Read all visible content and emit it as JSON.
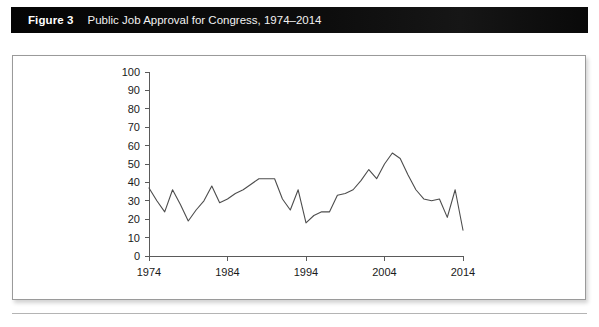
{
  "figure": {
    "label": "Figure 3",
    "title": "Public Job Approval for Congress, 1974–2014"
  },
  "colors": {
    "titlebar_background": "#0b0b0b",
    "titlebar_text": "#ffffff",
    "frame_border": "#9a9a9a",
    "axis": "#5a5a5a",
    "series_line": "#4d4d4d",
    "page_background": "#ffffff"
  },
  "chart_data": {
    "type": "line",
    "title": "Public Job Approval for Congress, 1974–2014",
    "xlabel": "",
    "ylabel": "",
    "xlim": [
      1974,
      2014
    ],
    "ylim": [
      0,
      100
    ],
    "grid": false,
    "legend": false,
    "legend_position": "none",
    "x_tick_labels": [
      "1974",
      "1984",
      "1994",
      "2004",
      "2014"
    ],
    "x_ticks": [
      1974,
      1984,
      1994,
      2004,
      2014
    ],
    "y_tick_labels": [
      "0",
      "10",
      "20",
      "30",
      "40",
      "50",
      "60",
      "70",
      "80",
      "90",
      "100"
    ],
    "y_ticks": [
      0,
      10,
      20,
      30,
      40,
      50,
      60,
      70,
      80,
      90,
      100
    ],
    "series": [
      {
        "name": "Public job approval for Congress",
        "x": [
          1974,
          1975,
          1976,
          1977,
          1978,
          1979,
          1980,
          1981,
          1982,
          1983,
          1984,
          1985,
          1986,
          1987,
          1988,
          1989,
          1990,
          1991,
          1992,
          1993,
          1994,
          1995,
          1996,
          1997,
          1998,
          1999,
          2000,
          2001,
          2002,
          2003,
          2004,
          2005,
          2006,
          2007,
          2008,
          2009,
          2010,
          2011,
          2012,
          2013,
          2014
        ],
        "values": [
          37,
          30,
          24,
          36,
          28,
          19,
          25,
          30,
          38,
          29,
          31,
          34,
          36,
          39,
          42,
          42,
          42,
          31,
          25,
          36,
          18,
          22,
          24,
          24,
          33,
          34,
          36,
          41,
          47,
          42,
          50,
          56,
          53,
          44,
          36,
          31,
          30,
          31,
          21,
          36,
          14
        ]
      }
    ],
    "annotations": []
  }
}
